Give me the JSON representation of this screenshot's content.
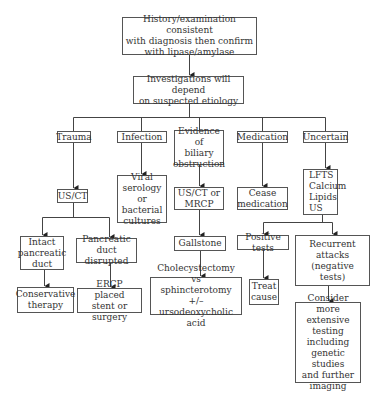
{
  "diagram": {
    "type": "flowchart",
    "nodes": {
      "start": "History/examination consistent\nwith diagnosis then confirm\nwith lipase/amylase",
      "investigations": "Investigations will depend\non suspected etiology",
      "trauma": "Trauma",
      "infection": "Infection",
      "biliary": "Evidence of\nbiliary\nobstruction",
      "medication": "Medication",
      "uncertain": "Uncertain",
      "us_ct": "US/CT",
      "viral": "Viral\nserology or\nbacterial\ncultures",
      "us_ct_mrcp": "US/CT or\nMRCP",
      "cease": "Cease\nmedication",
      "lfts": "LFTS\nCalcium\nLipids\nUS",
      "intact": "Intact\npancreatic\nduct",
      "disrupted": "Pancreatic\nduct disrupted",
      "gallstone": "Gallstone",
      "positive": "Positive tests",
      "recurrent": "Recurrent\nattacks\n(negative\ntests)",
      "conservative": "Conservative\ntherapy",
      "ercp": "ERCP placed\nstent or surgery",
      "cholecystectomy": "Cholecystectomy vs\nsphincterotomy +/–\nursodeoxycholic acid",
      "treat": "Treat\ncause",
      "consider": "Consider more\nextensive\ntesting\nincluding\ngenetic studies\nand further\nimaging"
    },
    "edges": [
      [
        "start",
        "investigations"
      ],
      [
        "investigations",
        "trauma"
      ],
      [
        "investigations",
        "infection"
      ],
      [
        "investigations",
        "biliary"
      ],
      [
        "investigations",
        "medication"
      ],
      [
        "investigations",
        "uncertain"
      ],
      [
        "trauma",
        "us_ct"
      ],
      [
        "infection",
        "viral"
      ],
      [
        "biliary",
        "us_ct_mrcp"
      ],
      [
        "medication",
        "cease"
      ],
      [
        "uncertain",
        "lfts"
      ],
      [
        "us_ct",
        "intact"
      ],
      [
        "us_ct",
        "disrupted"
      ],
      [
        "us_ct_mrcp",
        "gallstone"
      ],
      [
        "lfts",
        "positive"
      ],
      [
        "lfts",
        "recurrent"
      ],
      [
        "intact",
        "conservative"
      ],
      [
        "disrupted",
        "ercp"
      ],
      [
        "gallstone",
        "cholecystectomy"
      ],
      [
        "positive",
        "treat"
      ],
      [
        "recurrent",
        "consider"
      ]
    ]
  }
}
